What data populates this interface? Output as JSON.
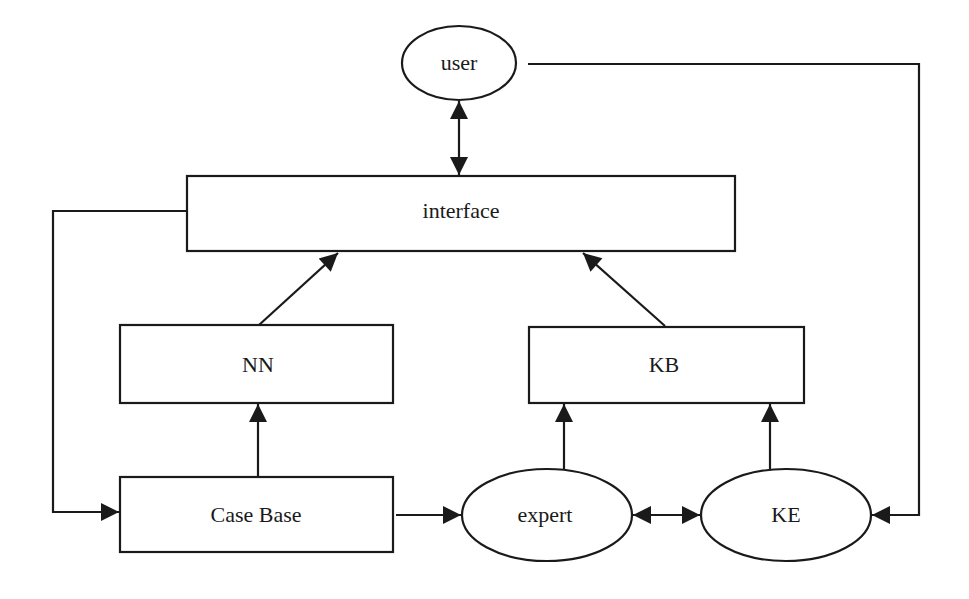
{
  "diagram": {
    "nodes": {
      "user": {
        "label": "user",
        "shape": "ellipse"
      },
      "interface": {
        "label": "interface",
        "shape": "rect"
      },
      "nn": {
        "label": "NN",
        "shape": "rect"
      },
      "kb": {
        "label": "KB",
        "shape": "rect"
      },
      "case_base": {
        "label": "Case Base",
        "shape": "rect"
      },
      "expert": {
        "label": "expert",
        "shape": "ellipse"
      },
      "ke": {
        "label": "KE",
        "shape": "ellipse"
      }
    },
    "edges": [
      {
        "from": "user",
        "to": "interface",
        "bidirectional": true
      },
      {
        "from": "nn",
        "to": "interface",
        "bidirectional": false
      },
      {
        "from": "kb",
        "to": "interface",
        "bidirectional": false
      },
      {
        "from": "case_base",
        "to": "nn",
        "bidirectional": false
      },
      {
        "from": "expert",
        "to": "kb",
        "bidirectional": false
      },
      {
        "from": "ke",
        "to": "kb",
        "bidirectional": false
      },
      {
        "from": "case_base",
        "to": "expert",
        "bidirectional": false
      },
      {
        "from": "expert",
        "to": "ke",
        "bidirectional": true
      },
      {
        "from": "interface",
        "to": "case_base",
        "bidirectional": false
      },
      {
        "from": "user",
        "to": "ke",
        "bidirectional": false
      }
    ],
    "colors": {
      "stroke": "#1a1a1a",
      "background": "#ffffff"
    }
  }
}
